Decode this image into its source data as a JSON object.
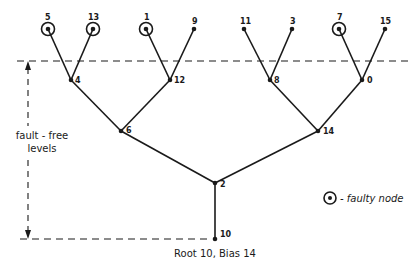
{
  "diagram": {
    "type": "binary-tree",
    "root_caption": "Root 10, Bias 14",
    "side_label": {
      "line1": "fault - free",
      "line2": "levels"
    },
    "legend": {
      "symbol": "circled-dot",
      "text": "- faulty node"
    },
    "nodes": [
      {
        "id": "5",
        "x": 48,
        "y": 29,
        "faulty": true,
        "label_dx": -3,
        "label_dy": -9
      },
      {
        "id": "13",
        "x": 93,
        "y": 29,
        "faulty": true,
        "label_dx": -5,
        "label_dy": -9
      },
      {
        "id": "1",
        "x": 146,
        "y": 29,
        "faulty": true,
        "label_dx": -2,
        "label_dy": -9
      },
      {
        "id": "9",
        "x": 194,
        "y": 29,
        "faulty": false,
        "label_dx": -2,
        "label_dy": -5
      },
      {
        "id": "11",
        "x": 244,
        "y": 29,
        "faulty": false,
        "label_dx": -4,
        "label_dy": -5
      },
      {
        "id": "3",
        "x": 292,
        "y": 29,
        "faulty": false,
        "label_dx": -2,
        "label_dy": -5
      },
      {
        "id": "7",
        "x": 339,
        "y": 29,
        "faulty": true,
        "label_dx": -2,
        "label_dy": -9
      },
      {
        "id": "15",
        "x": 385,
        "y": 29,
        "faulty": false,
        "label_dx": -5,
        "label_dy": -5
      },
      {
        "id": "4",
        "x": 71,
        "y": 80,
        "faulty": false,
        "label_dx": 4,
        "label_dy": 3
      },
      {
        "id": "12",
        "x": 170,
        "y": 80,
        "faulty": false,
        "label_dx": 4,
        "label_dy": 3
      },
      {
        "id": "8",
        "x": 270,
        "y": 80,
        "faulty": false,
        "label_dx": 4,
        "label_dy": 3
      },
      {
        "id": "0",
        "x": 362,
        "y": 80,
        "faulty": false,
        "label_dx": 5,
        "label_dy": 3
      },
      {
        "id": "6",
        "x": 121,
        "y": 131,
        "faulty": false,
        "label_dx": 5,
        "label_dy": 2
      },
      {
        "id": "14",
        "x": 318,
        "y": 131,
        "faulty": false,
        "label_dx": 5,
        "label_dy": 3
      },
      {
        "id": "2",
        "x": 215,
        "y": 183,
        "faulty": false,
        "label_dx": 5,
        "label_dy": 4
      },
      {
        "id": "10",
        "x": 215,
        "y": 239,
        "faulty": false,
        "label_dx": 5,
        "label_dy": -2
      }
    ],
    "edges": [
      [
        "10",
        "2"
      ],
      [
        "2",
        "6"
      ],
      [
        "2",
        "14"
      ],
      [
        "6",
        "4"
      ],
      [
        "6",
        "12"
      ],
      [
        "14",
        "8"
      ],
      [
        "14",
        "0"
      ],
      [
        "4",
        "5"
      ],
      [
        "4",
        "13"
      ],
      [
        "12",
        "1"
      ],
      [
        "12",
        "9"
      ],
      [
        "8",
        "11"
      ],
      [
        "8",
        "3"
      ],
      [
        "0",
        "7"
      ],
      [
        "0",
        "15"
      ]
    ]
  }
}
